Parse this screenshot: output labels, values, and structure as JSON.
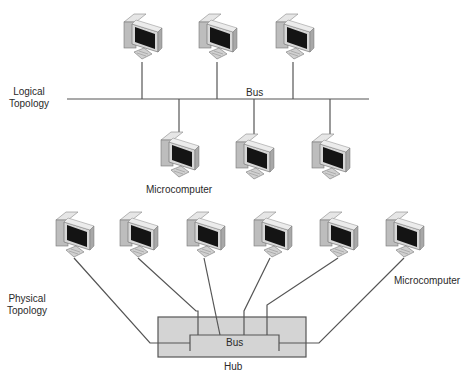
{
  "diagram": {
    "logical": {
      "title_line1": "Logical",
      "title_line2": "Topology",
      "bus_label": "Bus",
      "node_label": "Microcomputer",
      "upper_nodes": [
        {
          "x": 120,
          "y": 10
        },
        {
          "x": 195,
          "y": 10
        },
        {
          "x": 272,
          "y": 10
        }
      ],
      "lower_nodes": [
        {
          "x": 157,
          "y": 126
        },
        {
          "x": 232,
          "y": 128
        },
        {
          "x": 308,
          "y": 128
        }
      ]
    },
    "physical": {
      "title_line1": "Physical",
      "title_line2": "Topology",
      "hub_label": "Hub",
      "bus_label": "Bus",
      "node_label": "Microcomputer",
      "nodes": [
        {
          "x": 52,
          "y": 208
        },
        {
          "x": 116,
          "y": 208
        },
        {
          "x": 183,
          "y": 208
        },
        {
          "x": 250,
          "y": 208
        },
        {
          "x": 316,
          "y": 208
        },
        {
          "x": 382,
          "y": 208
        }
      ]
    },
    "colors": {
      "line": "#555555",
      "hub_fill": "#d4d4d4",
      "hub_border": "#555555",
      "screen": "#141414",
      "case": "#c8c8c8"
    }
  }
}
